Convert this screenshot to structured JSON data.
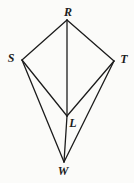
{
  "diagram": {
    "background_color": "#fbfbf9",
    "stroke_color": "#1c1c1c",
    "stroke_width": 1.3,
    "label_color": "#1c1c1c",
    "width": 134,
    "height": 183,
    "points": {
      "R": {
        "x": 67,
        "y": 20,
        "label": "R",
        "label_x": 68,
        "label_y": 16
      },
      "S": {
        "x": 22,
        "y": 60,
        "label": "S",
        "label_x": 11,
        "label_y": 62
      },
      "T": {
        "x": 114,
        "y": 61,
        "label": "T",
        "label_x": 124,
        "label_y": 63
      },
      "L": {
        "x": 67,
        "y": 116,
        "label": "L",
        "label_x": 73,
        "label_y": 127
      },
      "W": {
        "x": 64,
        "y": 162,
        "label": "W",
        "label_x": 63,
        "label_y": 175
      }
    },
    "edges": [
      [
        "R",
        "S"
      ],
      [
        "R",
        "T"
      ],
      [
        "S",
        "L"
      ],
      [
        "T",
        "L"
      ],
      [
        "R",
        "L"
      ],
      [
        "L",
        "W"
      ],
      [
        "S",
        "W"
      ],
      [
        "T",
        "W"
      ]
    ]
  }
}
